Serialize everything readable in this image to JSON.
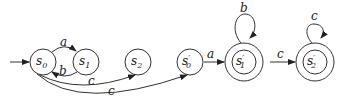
{
  "diagram": {
    "type": "finite-automaton",
    "states": [
      {
        "id": "s0",
        "base": "s",
        "prime": "",
        "sub": "0",
        "accepting": false,
        "initial": true
      },
      {
        "id": "s1",
        "base": "s",
        "prime": "",
        "sub": "1",
        "accepting": false,
        "initial": false
      },
      {
        "id": "s2",
        "base": "s",
        "prime": "",
        "sub": "2",
        "accepting": false,
        "initial": false
      },
      {
        "id": "s0p",
        "base": "s",
        "prime": "′",
        "sub": "0",
        "accepting": false,
        "initial": false
      },
      {
        "id": "s1p",
        "base": "s",
        "prime": "′",
        "sub": "1",
        "accepting": true,
        "initial": false
      },
      {
        "id": "s2p",
        "base": "s",
        "prime": "′",
        "sub": "2",
        "accepting": true,
        "initial": false
      }
    ],
    "transitions": [
      {
        "from": "s0",
        "to": "s1",
        "label": "a"
      },
      {
        "from": "s1",
        "to": "s0",
        "label": "b"
      },
      {
        "from": "s0",
        "to": "s2",
        "label": "c"
      },
      {
        "from": "s0",
        "to": "s0p",
        "label": "c"
      },
      {
        "from": "s0p",
        "to": "s1p",
        "label": "a"
      },
      {
        "from": "s1p",
        "to": "s1p",
        "label": "b"
      },
      {
        "from": "s1p",
        "to": "s2p",
        "label": "c"
      },
      {
        "from": "s2p",
        "to": "s2p",
        "label": "c"
      }
    ]
  }
}
